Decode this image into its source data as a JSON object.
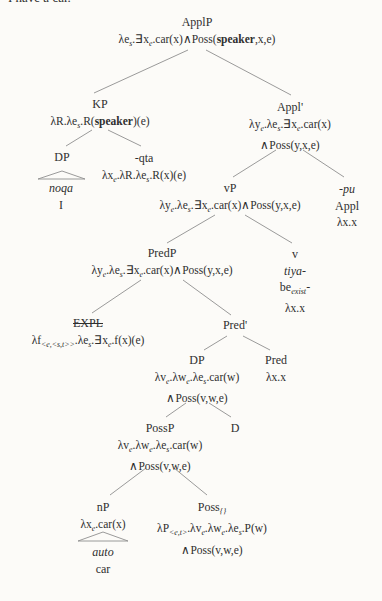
{
  "sentence_top": "I have a car.",
  "colors": {
    "background": "#fcfbf8",
    "ink": "#2f2f2f",
    "tree_line": "#8f8f8f"
  },
  "nodes": {
    "applp": {
      "lines": [
        "ApplP",
        "λe~s~.∃x~e~.car(x)∧Poss(**speaker**,x,e)"
      ]
    },
    "kp": {
      "lines": [
        "KP",
        "λR.λe~s~.R(**speaker**)(e)"
      ]
    },
    "dp1": {
      "lines": [
        "DP"
      ]
    },
    "qta": {
      "lines": [
        "-qta",
        "λx~e~.λR.λe~s~.R(x)(e)"
      ]
    },
    "noqa": {
      "lines": [
        "//noqa//",
        "I"
      ]
    },
    "appl1": {
      "lines": [
        "Appl'",
        "λy~e~.λe~s~.∃x~e~.car(x)",
        "∧Poss(y,x,e)"
      ]
    },
    "vp": {
      "lines": [
        "vP",
        "λy~e~.λe~s~.∃x~e~.car(x)∧Poss(y,x,e)"
      ]
    },
    "pu": {
      "lines": [
        "//-pu//",
        "Appl",
        "λx.x"
      ]
    },
    "predp": {
      "lines": [
        "PredP",
        "λy~e~.λe~s~.∃x~e~.car(x)∧Poss(y,x,e)"
      ]
    },
    "v": {
      "lines": [
        "v",
        "//tiya-//",
        "be~exist~-",
        "λx.x"
      ]
    },
    "expl": {
      "lines": [
        "--EXPL--",
        "λf~<e,<s,t>>~.λe~s~.∃x~e~.f(x)(e)"
      ]
    },
    "pred1": {
      "lines": [
        "Pred'"
      ]
    },
    "dp2": {
      "lines": [
        "DP",
        "λv~e~.λw~e~.λe~s~.car(w)",
        "∧Poss(v,w,e)"
      ]
    },
    "pred": {
      "lines": [
        "Pred",
        "λx.x"
      ]
    },
    "possp": {
      "lines": [
        "PossP",
        "λv~e~.λw~e~.λe~s~.car(w)",
        "∧Poss(v,w,e)"
      ]
    },
    "d": {
      "lines": [
        "D"
      ]
    },
    "np": {
      "lines": [
        "nP",
        "λx~e~.car(x)"
      ]
    },
    "poss": {
      "lines": [
        "Poss~{}~",
        "λP~<e,t>~.λv~e~.λw~e~.λe~s~.P(w)",
        "∧Poss(v,w,e)"
      ]
    },
    "auto": {
      "lines": [
        "//auto//",
        "car"
      ]
    }
  }
}
